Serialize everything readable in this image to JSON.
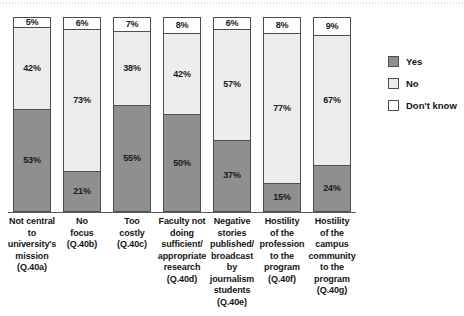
{
  "chart_data": {
    "type": "bar",
    "subtype": "stacked-vertical-100-percent",
    "title": "",
    "subtitle": "",
    "xlabel": "",
    "ylabel": "",
    "ylim": [
      0,
      100
    ],
    "grid": false,
    "legend_position": "right",
    "value_suffix": "%",
    "categories": [
      "Not central to university's mission (Q.40a)",
      "No focus (Q.40b)",
      "Too costly (Q.40c)",
      "Faculty not doing sufficient/appropriate research (Q.40d)",
      "Negative stories published/broadcast by journalism students (Q.40e)",
      "Hostility of the profession to the program (Q.40f)",
      "Hostility of the campus community to the program (Q.40g)"
    ],
    "category_lines": [
      [
        "Not central",
        "to",
        "university's",
        "mission",
        "(Q.40a)"
      ],
      [
        "No",
        "focus",
        "(Q.40b)"
      ],
      [
        "Too",
        "costly",
        "(Q.40c)"
      ],
      [
        "Faculty not",
        "doing",
        "sufficient/",
        "appropriate",
        "research",
        "(Q.40d)"
      ],
      [
        "Negative",
        "stories",
        "published/",
        "broadcast",
        "by",
        "journalism",
        "students",
        "(Q.40e)"
      ],
      [
        "Hostility",
        "of the",
        "profession",
        "to the",
        "program",
        "(Q.40f)"
      ],
      [
        "Hostility",
        "of the",
        "campus",
        "community",
        "to the",
        "program",
        "(Q.40g)"
      ]
    ],
    "series": [
      {
        "name": "Yes",
        "color": "#8f8f8f",
        "values": [
          53,
          21,
          55,
          50,
          37,
          15,
          24
        ]
      },
      {
        "name": "No",
        "color": "#ededed",
        "values": [
          42,
          73,
          38,
          42,
          57,
          77,
          67
        ]
      },
      {
        "name": "Don't know",
        "color": "#ffffff",
        "values": [
          5,
          6,
          7,
          8,
          6,
          8,
          9
        ]
      }
    ],
    "bar_labels": [
      {
        "category_index": 0,
        "dont_know": "5%",
        "no": "42%",
        "yes": "53%"
      },
      {
        "category_index": 1,
        "dont_know": "6%",
        "no": "73%",
        "yes": "21%"
      },
      {
        "category_index": 2,
        "dont_know": "7%",
        "no": "38%",
        "yes": "55%"
      },
      {
        "category_index": 3,
        "dont_know": "8%",
        "no": "42%",
        "yes": "50%"
      },
      {
        "category_index": 4,
        "dont_know": "6%",
        "no": "57%",
        "yes": "37%"
      },
      {
        "category_index": 5,
        "dont_know": "8%",
        "no": "77%",
        "yes": "15%"
      },
      {
        "category_index": 6,
        "dont_know": "9%",
        "no": "67%",
        "yes": "24%"
      }
    ]
  },
  "legend": {
    "items": [
      {
        "label": "Yes",
        "swatch": "legend-swatch-yes"
      },
      {
        "label": "No",
        "swatch": "legend-swatch-no"
      },
      {
        "label": "Don't know",
        "swatch": "legend-swatch-dont-know"
      }
    ]
  },
  "colors": {
    "yes": "#8f8f8f",
    "no": "#ededed",
    "dont_know": "#ffffff",
    "outline": "#4d4d4d",
    "axis": "#5a5a5a",
    "text": "#141414",
    "background": "#ffffff"
  }
}
